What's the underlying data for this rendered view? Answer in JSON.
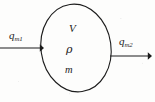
{
  "figure": {
    "name": "control-volume-mass-flow-diagram",
    "background_color": "#fdfdfc",
    "stroke_color": "#1c1c1c",
    "text_color": "#1c1c1c"
  },
  "control_volume": {
    "shape": "ellipse",
    "center_x": 76,
    "center_y": 48,
    "radius_x": 35,
    "radius_y": 44,
    "rotation_deg": -8,
    "stroke_width": 1.1,
    "labels": [
      {
        "id": "volume",
        "text": "V",
        "symbol_name": "volume-symbol",
        "x": 69,
        "y": 23
      },
      {
        "id": "density",
        "text": "ρ",
        "symbol_name": "density-symbol",
        "x": 66,
        "y": 44
      },
      {
        "id": "mass",
        "text": "m",
        "symbol_name": "mass-symbol",
        "x": 65,
        "y": 65
      }
    ]
  },
  "arrows": {
    "inlet": {
      "id": "qm1",
      "symbol": "q",
      "subscript": "m1",
      "label_x": 9,
      "label_y": 30,
      "line_x1": 0,
      "line_x2": 44,
      "line_y": 48,
      "direction": "right",
      "description": "inlet mass flow rate"
    },
    "outlet": {
      "id": "qm2",
      "symbol": "q",
      "subscript": "m2",
      "label_x": 119,
      "label_y": 36,
      "line_x1": 110,
      "line_x2": 152,
      "line_y": 56,
      "direction": "right",
      "description": "outlet mass flow rate"
    }
  }
}
